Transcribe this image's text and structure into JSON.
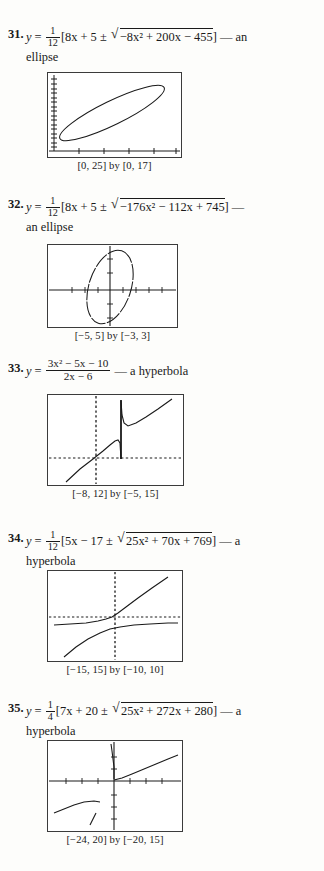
{
  "page": {
    "background": "#fdfdfb",
    "ink": "#1a1a1a",
    "width": 324,
    "height": 871
  },
  "problems": [
    {
      "number": "31.",
      "lhs": "y",
      "equals": "=",
      "fraction": {
        "numerator": "1",
        "denominator": "12"
      },
      "bracket_open": "[",
      "pre_radical": "8x + 5 ±",
      "radical_sign": "√",
      "radicand": "−8x² + 200x − 455",
      "bracket_close": "]",
      "dash": "—",
      "classification": "an ellipse",
      "expression_plain": "y = 1/12[8x + 5 ± √(−8x² + 200x − 455)] — an ellipse",
      "graph": {
        "caption": "[0, 25] by [0, 17]",
        "xmin": 0,
        "xmax": 25,
        "ymin": 0,
        "ymax": 17,
        "curve_type": "ellipse",
        "axes_style": "corner-axes",
        "x_axis_visible": true,
        "y_axis_visible": true,
        "tick_count_x": 5,
        "tick_count_y": 17
      }
    },
    {
      "number": "32.",
      "lhs": "y",
      "equals": "=",
      "fraction": {
        "numerator": "1",
        "denominator": "12"
      },
      "bracket_open": "[",
      "pre_radical": "8x + 5 ±",
      "radical_sign": "√",
      "radicand": "−176x² − 112x + 745",
      "bracket_close": "]",
      "dash": "—",
      "classification": "an ellipse",
      "expression_plain": "y = 1/12[8x + 5 ± √(−176x² − 112x + 745)] — an ellipse",
      "graph": {
        "caption": "[−5, 5] by [−3, 3]",
        "xmin": -5,
        "xmax": 5,
        "ymin": -3,
        "ymax": 3,
        "curve_type": "ellipse-tilted",
        "axes_style": "centered-axes",
        "x_axis_visible": true,
        "y_axis_visible": true,
        "tick_count_x": 10,
        "tick_count_y": 6
      }
    },
    {
      "number": "33.",
      "lhs": "y",
      "equals": "=",
      "fraction": {
        "numerator": "3x² − 5x − 10",
        "denominator": "2x − 6"
      },
      "dash": "—",
      "classification": "a hyperbola",
      "expression_plain": "y = (3x² − 5x − 10)/(2x − 6) — a hyperbola",
      "graph": {
        "caption": "[−8, 12] by [−5, 15]",
        "xmin": -8,
        "xmax": 12,
        "ymin": -5,
        "ymax": 15,
        "curve_type": "rational-hyperbola",
        "asymptote_x": 3,
        "axes_style": "dotted-axes",
        "x_axis_visible": true,
        "y_axis_visible": true,
        "tick_count_x": 20,
        "tick_count_y": 20
      }
    },
    {
      "number": "34.",
      "lhs": "y",
      "equals": "=",
      "fraction": {
        "numerator": "1",
        "denominator": "12"
      },
      "bracket_open": "[",
      "pre_radical": "5x − 17 ±",
      "radical_sign": "√",
      "radicand": "25x² + 70x + 769",
      "bracket_close": "]",
      "dash": "—",
      "classification": "a hyperbola",
      "expression_plain": "y = 1/12[5x − 17 ± √(25x² + 70x + 769)] — a hyperbola",
      "graph": {
        "caption": "[−15, 15] by [−10, 10]",
        "xmin": -15,
        "xmax": 15,
        "ymin": -10,
        "ymax": 10,
        "curve_type": "hyperbola-two-branch",
        "axes_style": "dotted-axes",
        "x_axis_visible": true,
        "y_axis_visible": true,
        "tick_count_x": 30,
        "tick_count_y": 20
      }
    },
    {
      "number": "35.",
      "lhs": "y",
      "equals": "=",
      "fraction": {
        "numerator": "1",
        "denominator": "4"
      },
      "bracket_open": "[",
      "pre_radical": "7x + 20 ±",
      "radical_sign": "√",
      "radicand": "25x² + 272x + 280",
      "bracket_close": "]",
      "dash": "—",
      "classification": "a hyperbola",
      "expression_plain": "y = 1/4[7x + 20 ± √(25x² + 272x + 280)] — a hyperbola",
      "graph": {
        "caption": "[−24, 20] by [−20, 15]",
        "xmin": -24,
        "xmax": 20,
        "ymin": -20,
        "ymax": 15,
        "curve_type": "hyperbola-two-branch-wide",
        "axes_style": "solid-axes",
        "x_axis_visible": true,
        "y_axis_visible": true,
        "tick_count_x": 11,
        "tick_count_y": 7
      }
    }
  ]
}
